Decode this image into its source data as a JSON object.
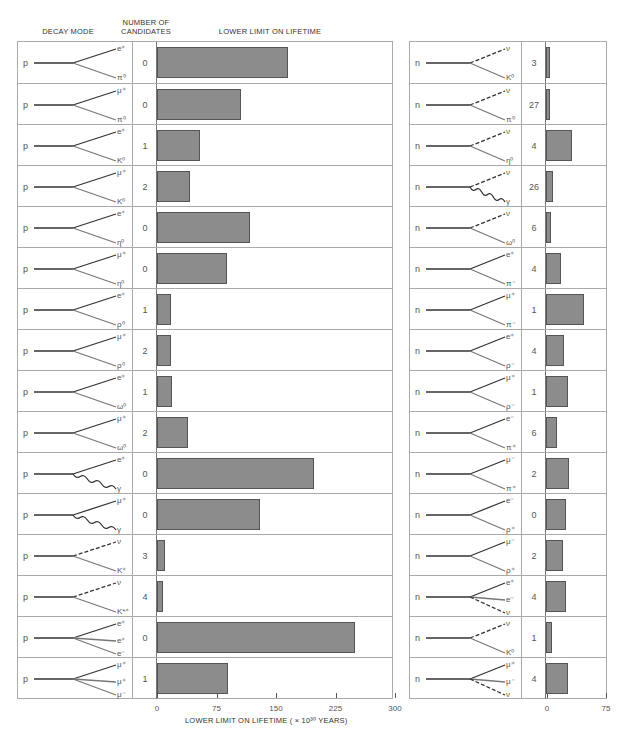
{
  "headers": {
    "decay_mode": "DECAY MODE",
    "number_of_candidates_line1": "NUMBER OF",
    "number_of_candidates_line2": "CANDIDATES",
    "lower_limit": "LOWER LIMIT ON LIFETIME"
  },
  "axis": {
    "left_ticks": [
      "0",
      "75",
      "150",
      "225",
      "300"
    ],
    "right_ticks": [
      "0",
      "75"
    ],
    "xlabel": "LOWER LIMIT ON LIFETIME  ( × 10³⁰ YEARS)"
  },
  "colors": {
    "bar_fill": "#8c8c8c",
    "bar_border": "#555555",
    "grid": "#aaaaaa"
  },
  "chart_data": {
    "type": "bar",
    "xlabel": "LOWER LIMIT ON LIFETIME (× 10^30 YEARS)",
    "orientation": "horizontal",
    "panels": [
      {
        "name": "proton",
        "xlim": [
          0,
          300
        ],
        "rows": [
          {
            "parent": "p",
            "products": [
              "e⁺",
              "π⁰"
            ],
            "lines": [
              "solid",
              "solid"
            ],
            "candidates": "0",
            "value": 164
          },
          {
            "parent": "p",
            "products": [
              "μ⁺",
              "π⁰"
            ],
            "lines": [
              "solid",
              "solid"
            ],
            "candidates": "0",
            "value": 105
          },
          {
            "parent": "p",
            "products": [
              "e⁺",
              "K⁰"
            ],
            "lines": [
              "solid",
              "solid"
            ],
            "candidates": "1",
            "value": 54
          },
          {
            "parent": "p",
            "products": [
              "μ⁺",
              "K⁰"
            ],
            "lines": [
              "solid",
              "solid"
            ],
            "candidates": "2",
            "value": 41
          },
          {
            "parent": "p",
            "products": [
              "e⁺",
              "η⁰"
            ],
            "lines": [
              "solid",
              "solid"
            ],
            "candidates": "0",
            "value": 116
          },
          {
            "parent": "p",
            "products": [
              "μ⁺",
              "η⁰"
            ],
            "lines": [
              "solid",
              "solid"
            ],
            "candidates": "0",
            "value": 88
          },
          {
            "parent": "p",
            "products": [
              "e⁺",
              "ρ⁰"
            ],
            "lines": [
              "solid",
              "solid"
            ],
            "candidates": "1",
            "value": 17
          },
          {
            "parent": "p",
            "products": [
              "μ⁺",
              "ρ⁰"
            ],
            "lines": [
              "solid",
              "solid"
            ],
            "candidates": "2",
            "value": 18
          },
          {
            "parent": "p",
            "products": [
              "e⁺",
              "ω⁰"
            ],
            "lines": [
              "solid",
              "solid"
            ],
            "candidates": "1",
            "value": 19
          },
          {
            "parent": "p",
            "products": [
              "μ⁺",
              "ω⁰"
            ],
            "lines": [
              "solid",
              "solid"
            ],
            "candidates": "2",
            "value": 39
          },
          {
            "parent": "p",
            "products": [
              "e⁺",
              "γ"
            ],
            "lines": [
              "solid",
              "wavy"
            ],
            "candidates": "0",
            "value": 196
          },
          {
            "parent": "p",
            "products": [
              "μ⁺",
              "γ"
            ],
            "lines": [
              "solid",
              "wavy"
            ],
            "candidates": "0",
            "value": 129
          },
          {
            "parent": "p",
            "products": [
              "ν",
              "K⁺"
            ],
            "lines": [
              "dashed",
              "solid"
            ],
            "candidates": "3",
            "value": 10
          },
          {
            "parent": "p",
            "products": [
              "ν",
              "K*⁺"
            ],
            "lines": [
              "dashed",
              "solid"
            ],
            "candidates": "4",
            "value": 8
          },
          {
            "parent": "p",
            "products": [
              "e⁺",
              "e⁺",
              "e⁻"
            ],
            "lines": [
              "solid",
              "solid",
              "solid"
            ],
            "candidates": "0",
            "value": 248
          },
          {
            "parent": "p",
            "products": [
              "μ⁺",
              "μ⁺",
              "μ⁻"
            ],
            "lines": [
              "solid",
              "solid",
              "solid"
            ],
            "candidates": "1",
            "value": 89
          }
        ]
      },
      {
        "name": "neutron",
        "xlim": [
          0,
          75
        ],
        "rows": [
          {
            "parent": "n",
            "products": [
              "ν",
              "K⁰"
            ],
            "lines": [
              "dashed",
              "solid"
            ],
            "candidates": "3",
            "value": 5
          },
          {
            "parent": "n",
            "products": [
              "ν",
              "π⁰"
            ],
            "lines": [
              "dashed",
              "solid"
            ],
            "candidates": "27",
            "value": 5
          },
          {
            "parent": "n",
            "products": [
              "ν",
              "η⁰"
            ],
            "lines": [
              "dashed",
              "solid"
            ],
            "candidates": "4",
            "value": 33
          },
          {
            "parent": "n",
            "products": [
              "ν",
              "γ"
            ],
            "lines": [
              "dashed",
              "wavy"
            ],
            "candidates": "26",
            "value": 9
          },
          {
            "parent": "n",
            "products": [
              "ν",
              "ω⁰"
            ],
            "lines": [
              "dashed",
              "solid"
            ],
            "candidates": "6",
            "value": 6
          },
          {
            "parent": "n",
            "products": [
              "e⁺",
              "π⁻"
            ],
            "lines": [
              "solid",
              "solid"
            ],
            "candidates": "4",
            "value": 19
          },
          {
            "parent": "n",
            "products": [
              "μ⁺",
              "π⁻"
            ],
            "lines": [
              "solid",
              "solid"
            ],
            "candidates": "1",
            "value": 48
          },
          {
            "parent": "n",
            "products": [
              "e⁺",
              "ρ⁻"
            ],
            "lines": [
              "solid",
              "solid"
            ],
            "candidates": "4",
            "value": 23
          },
          {
            "parent": "n",
            "products": [
              "μ⁺",
              "ρ⁻"
            ],
            "lines": [
              "solid",
              "solid"
            ],
            "candidates": "1",
            "value": 28
          },
          {
            "parent": "n",
            "products": [
              "e⁻",
              "π⁺"
            ],
            "lines": [
              "solid",
              "solid"
            ],
            "candidates": "6",
            "value": 14
          },
          {
            "parent": "n",
            "products": [
              "μ⁻",
              "π⁺"
            ],
            "lines": [
              "solid",
              "solid"
            ],
            "candidates": "2",
            "value": 29
          },
          {
            "parent": "n",
            "products": [
              "e⁻",
              "ρ⁺"
            ],
            "lines": [
              "solid",
              "solid"
            ],
            "candidates": "0",
            "value": 25
          },
          {
            "parent": "n",
            "products": [
              "μ⁻",
              "ρ⁺"
            ],
            "lines": [
              "solid",
              "solid"
            ],
            "candidates": "2",
            "value": 22
          },
          {
            "parent": "n",
            "products": [
              "e⁺",
              "e⁻",
              "ν"
            ],
            "lines": [
              "solid",
              "solid",
              "dashed"
            ],
            "candidates": "4",
            "value": 25
          },
          {
            "parent": "n",
            "products": [
              "ν",
              "K⁰"
            ],
            "lines": [
              "dashed",
              "solid"
            ],
            "candidates": "1",
            "value": 8
          },
          {
            "parent": "n",
            "products": [
              "μ⁺",
              "μ⁻",
              "ν"
            ],
            "lines": [
              "solid",
              "solid",
              "dashed"
            ],
            "candidates": "4",
            "value": 28
          }
        ]
      }
    ],
    "legend": [],
    "grid": false
  }
}
